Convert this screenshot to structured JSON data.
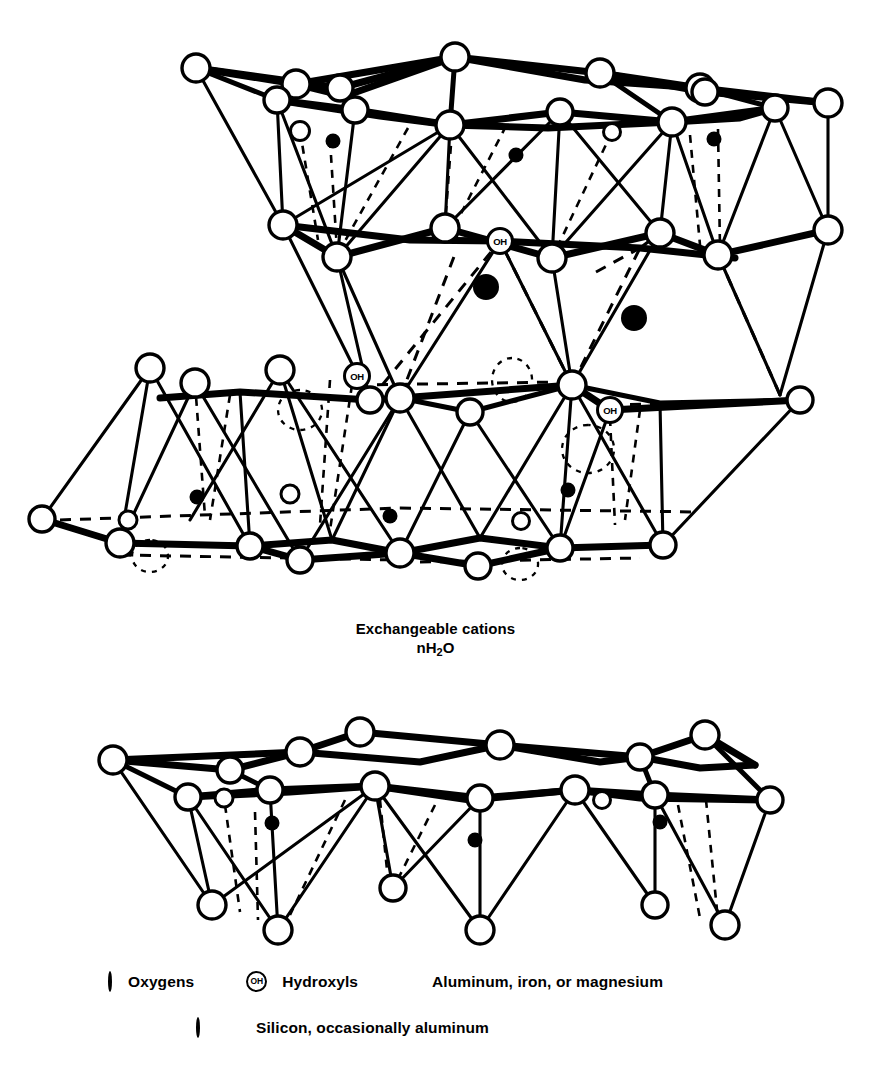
{
  "figure": {
    "title_fragment": "",
    "colors": {
      "ink": "#000000",
      "paper": "#ffffff"
    },
    "atom_labels": {
      "hydroxyl": "OH"
    }
  },
  "interlayer": {
    "line1": "Exchangeable cations",
    "line2_pre": "nH",
    "line2_sub": "2",
    "line2_post": "O"
  },
  "legend": {
    "row1": [
      {
        "icon": "open-circle-icon",
        "label": "Oxygens"
      },
      {
        "icon": "hydroxyl-circle-icon",
        "icon_text": "OH",
        "label": "Hydroxyls"
      },
      {
        "icon": "filled-circle-icon",
        "label": "Aluminum, iron, or magnesium"
      }
    ],
    "row2": [
      {
        "icon": "small-open-circle-icon",
        "icon2": "small-filled-circle-icon",
        "label": "Silicon, occasionally aluminum"
      }
    ]
  },
  "structure": {
    "upper_unit": {
      "name": "upper-2to1-layer",
      "sheets": [
        "tetrahedral-top",
        "octahedral-middle",
        "tetrahedral-bottom"
      ],
      "oh_positions": [
        {
          "x": 500,
          "y": 241
        },
        {
          "x": 357,
          "y": 376
        },
        {
          "x": 610,
          "y": 410
        }
      ],
      "octahedral_cations": [
        {
          "x": 486,
          "y": 287,
          "r": 13
        },
        {
          "x": 634,
          "y": 318,
          "r": 13
        }
      ]
    },
    "lower_unit": {
      "name": "lower-tetrahedral-sheet",
      "sheets": [
        "tetrahedral-top",
        "tetrahedral-bottom"
      ]
    }
  }
}
